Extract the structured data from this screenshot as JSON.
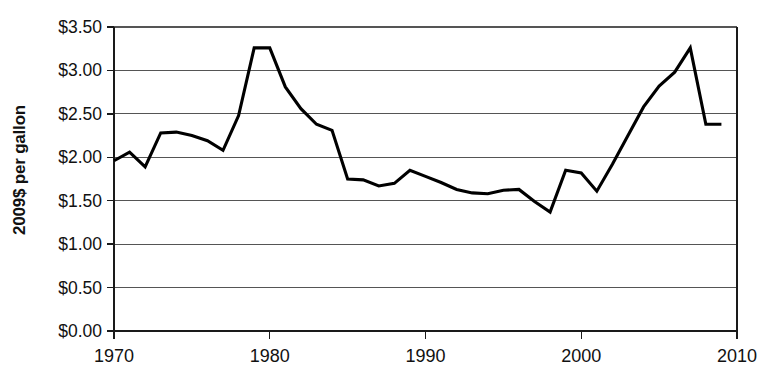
{
  "chart_data": {
    "type": "line",
    "title": "",
    "subtitle": "",
    "xlabel": "",
    "ylabel": "2009$ per gallon",
    "xlim": [
      1970,
      2010
    ],
    "ylim": [
      0.0,
      3.5
    ],
    "grid": true,
    "legend": null,
    "legend_position": "none",
    "y_tick_labels": [
      "$3.50",
      "$3.00",
      "$2.50",
      "$2.00",
      "$1.50",
      "$1.00",
      "$0.50",
      "$0.00"
    ],
    "y_tick_values": [
      3.5,
      3.0,
      2.5,
      2.0,
      1.5,
      1.0,
      0.5,
      0.0
    ],
    "x_tick_labels": [
      "1970",
      "1980",
      "1990",
      "2000",
      "2010"
    ],
    "x_tick_values": [
      1970,
      1980,
      1990,
      2000,
      2010
    ],
    "series": [
      {
        "name": "Gasoline price (2009 dollars per gallon)",
        "color": "#000000",
        "x": [
          1970,
          1971,
          1972,
          1973,
          1974,
          1975,
          1976,
          1977,
          1978,
          1979,
          1980,
          1981,
          1982,
          1983,
          1984,
          1985,
          1986,
          1987,
          1988,
          1989,
          1990,
          1991,
          1992,
          1993,
          1994,
          1995,
          1996,
          1997,
          1998,
          1999,
          2000,
          2001,
          2002,
          2003,
          2004,
          2005,
          2006,
          2007,
          2008,
          2009
        ],
        "values": [
          1.96,
          2.06,
          1.89,
          2.28,
          2.29,
          2.25,
          2.19,
          2.08,
          2.48,
          3.26,
          3.26,
          2.81,
          2.56,
          2.38,
          2.31,
          1.75,
          1.74,
          1.67,
          1.7,
          1.85,
          1.78,
          1.71,
          1.63,
          1.59,
          1.58,
          1.62,
          1.63,
          1.49,
          1.37,
          1.85,
          1.82,
          1.61,
          1.92,
          2.25,
          2.58,
          2.82,
          2.98,
          3.26,
          2.38,
          2.38
        ]
      }
    ]
  },
  "axis": {
    "y_axis_title": "2009$ per gallon"
  }
}
